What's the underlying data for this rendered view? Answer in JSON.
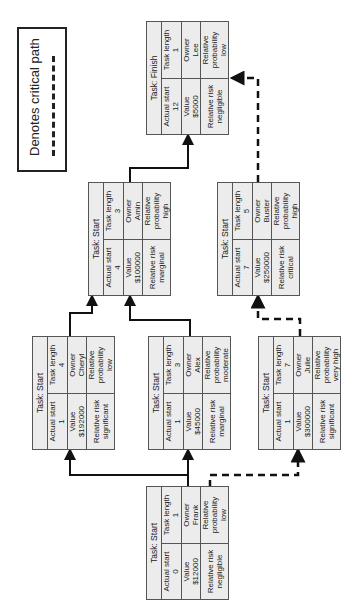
{
  "legend": {
    "label": "Denotes critical path",
    "line_style": "dashed"
  },
  "tasks": [
    {
      "id": "frank",
      "title": "Task: Start",
      "actual_start_label": "Actual start",
      "actual_start": "0",
      "task_length_label": "Task length",
      "task_length": "1",
      "value_label": "Value",
      "value": "$12000",
      "owner_label": "Owner",
      "owner": "Frank",
      "risk_label": "Relative risk",
      "risk": "negligible",
      "probability_label": "Relative probability",
      "probability": "low"
    },
    {
      "id": "cheryl",
      "title": "Task: Start",
      "actual_start_label": "Actual start",
      "actual_start": "1",
      "task_length_label": "Task length",
      "task_length": "4",
      "value_label": "Value",
      "value": "$192000",
      "owner_label": "Owner",
      "owner": "Cheryl",
      "risk_label": "Relative risk",
      "risk": "significant",
      "probability_label": "Relative probability",
      "probability": "low"
    },
    {
      "id": "alex",
      "title": "Task: Start",
      "actual_start_label": "Actual start",
      "actual_start": "1",
      "task_length_label": "Task length",
      "task_length": "3",
      "value_label": "Value",
      "value": "$45000",
      "owner_label": "Owner",
      "owner": "Alex",
      "risk_label": "Relative risk",
      "risk": "marginal",
      "probability_label": "Relative probability",
      "probability": "moderate"
    },
    {
      "id": "julie",
      "title": "Task: Start",
      "actual_start_label": "Actual start",
      "actual_start": "1",
      "task_length_label": "Task length",
      "task_length": "7",
      "value_label": "Value",
      "value": "$300000",
      "owner_label": "Owner",
      "owner": "Julie",
      "risk_label": "Relative risk",
      "risk": "significant",
      "probability_label": "Relative probability",
      "probability": "very high"
    },
    {
      "id": "amin",
      "title": "Task: Start",
      "actual_start_label": "Actual start",
      "actual_start": "4",
      "task_length_label": "Task length",
      "task_length": "3",
      "value_label": "Value",
      "value": "$100000",
      "owner_label": "Owner",
      "owner": "Amin",
      "risk_label": "Relative risk",
      "risk": "marginal",
      "probability_label": "Relative probability",
      "probability": "high"
    },
    {
      "id": "buster",
      "title": "Task: Start",
      "actual_start_label": "Actual start",
      "actual_start": "7",
      "task_length_label": "Task length",
      "task_length": "5",
      "value_label": "Value",
      "value": "$250000",
      "owner_label": "Owner",
      "owner": "Buster",
      "risk_label": "Relative risk",
      "risk": "critical",
      "probability_label": "Relative probability",
      "probability": "high"
    },
    {
      "id": "finish",
      "title": "Task: Finish",
      "actual_start_label": "Actual start",
      "actual_start": "12",
      "task_length_label": "Task length",
      "task_length": "1",
      "value_label": "Value",
      "value": "$5000",
      "owner_label": "Owner",
      "owner": "Lee",
      "risk_label": "Relative risk",
      "risk": "negligible",
      "probability_label": "Relative probability",
      "probability": "low"
    }
  ],
  "links": [
    {
      "from": "frank",
      "to": "cheryl",
      "critical": false
    },
    {
      "from": "frank",
      "to": "alex",
      "critical": false
    },
    {
      "from": "frank",
      "to": "julie",
      "critical": true
    },
    {
      "from": "cheryl",
      "to": "amin",
      "critical": false
    },
    {
      "from": "alex",
      "to": "amin",
      "critical": false
    },
    {
      "from": "julie",
      "to": "buster",
      "critical": true
    },
    {
      "from": "amin",
      "to": "finish",
      "critical": false
    },
    {
      "from": "buster",
      "to": "finish",
      "critical": true
    }
  ]
}
